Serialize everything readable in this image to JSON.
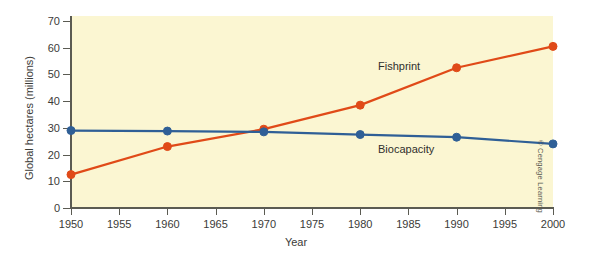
{
  "chart_data": {
    "type": "line",
    "title": "",
    "xlabel": "Year",
    "ylabel": "Global hectares (millions)",
    "x": [
      1950,
      1960,
      1970,
      1980,
      1990,
      2000
    ],
    "xlim": [
      1950,
      2000
    ],
    "ylim": [
      0,
      70
    ],
    "xticks": [
      1950,
      1955,
      1960,
      1965,
      1970,
      1975,
      1980,
      1985,
      1990,
      1995,
      2000
    ],
    "xtick_labels": [
      "1950",
      "1955",
      "1960",
      "1965",
      "1970",
      "1975",
      "1980",
      "1985",
      "1990",
      "1995",
      "2000"
    ],
    "yticks": [
      0,
      10,
      20,
      30,
      40,
      50,
      60,
      70
    ],
    "ytick_labels": [
      "0",
      "10",
      "20",
      "30",
      "40",
      "50",
      "60",
      "70"
    ],
    "grid": false,
    "legend_position": "inline-annotations",
    "plot_background": "#fbf6d2",
    "series": [
      {
        "name": "Fishprint",
        "color": "#e04a18",
        "marker": "circle",
        "values": [
          12.5,
          23.0,
          29.5,
          38.5,
          52.5,
          60.5
        ]
      },
      {
        "name": "Biocapacity",
        "color": "#2f5f96",
        "marker": "circle",
        "values": [
          29.0,
          28.8,
          28.5,
          27.5,
          26.5,
          24.0
        ]
      }
    ],
    "annotations": [
      {
        "text": "Fishprint",
        "x": 1984,
        "y": 46
      },
      {
        "text": "Biocapacity",
        "x": 1984,
        "y": 23
      }
    ]
  },
  "credit": "© Cengage Learning"
}
